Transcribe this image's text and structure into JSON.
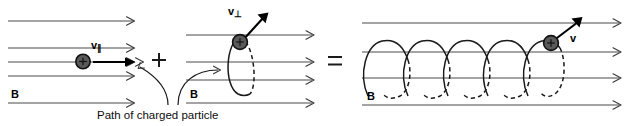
{
  "figure": {
    "caption": "Path of charged particle",
    "colors": {
      "field_line": "#4a4a4a",
      "orbit": "#1a1a1a",
      "particle_fill": "#595959",
      "particle_stroke": "#111111",
      "vector": "#000000",
      "background": "#ffffff"
    }
  },
  "panels": [
    {
      "id": "parallel-motion",
      "field_label": "B",
      "velocity_label": "v",
      "velocity_subscript": "∥",
      "description": "Uniform magnetic field lines with charged particle drifting parallel to B",
      "field_line_count": 5,
      "particle_charge": "+"
    },
    {
      "id": "perpendicular-motion",
      "field_label": "B",
      "velocity_label": "v",
      "velocity_subscript": "⊥",
      "description": "Circular orbit of charged particle perpendicular to B",
      "field_line_count": 4,
      "particle_charge": "+"
    },
    {
      "id": "helical-motion",
      "field_label": "B",
      "velocity_label": "v",
      "velocity_subscript": "",
      "description": "Resultant helical trajectory of charged particle along B",
      "field_line_count": 4,
      "helix_turns": 6,
      "particle_charge": "+"
    }
  ],
  "operators": {
    "plus": "+",
    "equals": "="
  }
}
